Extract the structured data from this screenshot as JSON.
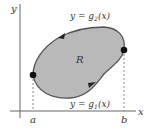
{
  "diagram": {
    "axes": {
      "x_label": "x",
      "y_label": "y",
      "color": "#555555"
    },
    "region": {
      "label": "R",
      "fill": "#b9b9b9",
      "stroke": "#555555"
    },
    "upper_curve": {
      "label_lhs": "y = g",
      "label_sub": "2",
      "label_rhs": "(x)"
    },
    "lower_curve": {
      "label_lhs": "y = g",
      "label_sub": "1",
      "label_rhs": "(x)"
    },
    "points": {
      "a": "a",
      "b": "b"
    }
  }
}
